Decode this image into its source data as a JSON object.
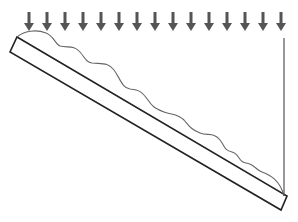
{
  "diagram": {
    "colors": {
      "background": "#ffffff",
      "slab_stroke": "#222222",
      "profile_stroke": "#666666",
      "arrow_fill": "#555555",
      "vertical_line": "#555555"
    },
    "load_arrows": {
      "count": 15,
      "direction": "down",
      "x_positions": [
        29,
        47,
        65,
        83,
        101,
        119,
        137,
        155,
        173,
        191,
        209,
        227,
        245,
        263,
        281
      ],
      "y_top": 12,
      "y_tip": 31
    },
    "slab": {
      "corners": [
        [
          17,
          37
        ],
        [
          287,
          196
        ],
        [
          281,
          210
        ],
        [
          10,
          52
        ]
      ],
      "label": ""
    },
    "profile": {
      "type": "wavy-surface-load",
      "path": "M 17 37 C 24 31, 36 29, 46 33 C 54 36, 55 44, 60 46 C 68 48, 74 45, 80 52 C 85 58, 86 62, 92 63 C 102 64, 108 62, 114 70 C 120 78, 122 88, 130 89 C 140 90, 142 92, 148 100 C 152 106, 154 108, 164 112 C 172 115, 178 114, 184 120 C 190 127, 192 130, 200 133 C 208 136, 214 132, 220 140 C 226 148, 224 150, 232 152 C 240 154, 238 162, 246 163 C 254 164, 256 170, 262 172 C 270 175, 280 180, 284 196"
    },
    "vertical_line": {
      "x": 284,
      "y_start": 38,
      "y_end": 196
    }
  }
}
